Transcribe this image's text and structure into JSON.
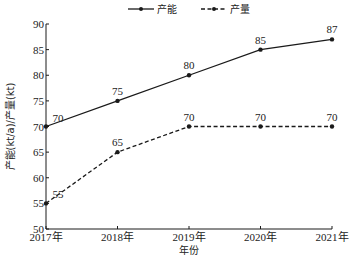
{
  "chart_data": {
    "type": "line",
    "title": "",
    "xlabel": "年份",
    "ylabel": "产能(kt/a)/产量(kt)",
    "categories": [
      "2017年",
      "2018年",
      "2019年",
      "2020年",
      "2021年"
    ],
    "series": [
      {
        "name": "产能",
        "style": "solid",
        "marker": "dot",
        "values": [
          70,
          75,
          80,
          85,
          87
        ]
      },
      {
        "name": "产量",
        "style": "dashed",
        "marker": "dot",
        "values": [
          55,
          65,
          70,
          70,
          70
        ]
      }
    ],
    "ylim": [
      50,
      90
    ],
    "yticks": [
      50,
      55,
      60,
      65,
      70,
      75,
      80,
      85,
      90
    ],
    "grid": false,
    "legend_position": "top-center",
    "data_labels": true
  },
  "colors": {
    "line": "#1a1a1a",
    "text": "#222222",
    "background": "#ffffff"
  }
}
